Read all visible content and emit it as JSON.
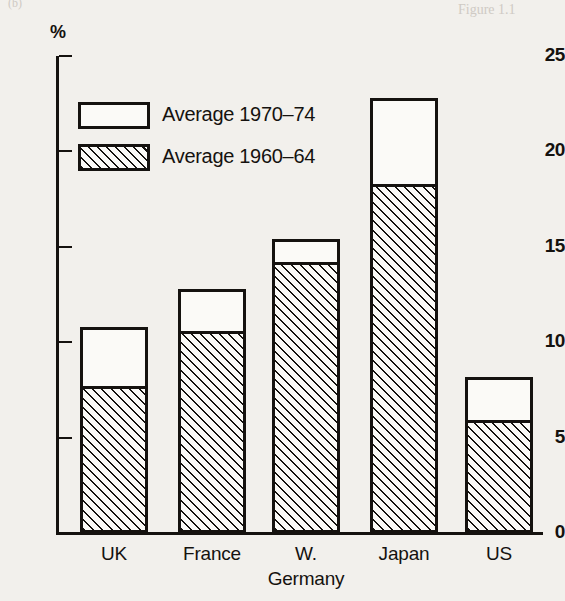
{
  "chart_data": {
    "type": "bar",
    "subtype": "stacked-bar",
    "title": "",
    "subtitle": "",
    "xlabel": "",
    "ylabel": "%",
    "ylim": [
      0,
      25
    ],
    "yticks": [
      0,
      5,
      10,
      15,
      20,
      25
    ],
    "ytick_labels": [
      "0",
      "5",
      "10",
      "15",
      "20",
      "25"
    ],
    "grid": false,
    "legend_position": "upper-left",
    "categories": [
      "UK",
      "France",
      "W.\nGermany",
      "Japan",
      "US"
    ],
    "category_labels": [
      {
        "line1": "UK",
        "line2": ""
      },
      {
        "line1": "France",
        "line2": ""
      },
      {
        "line1": "W.",
        "line2": "Germany"
      },
      {
        "line1": "Japan",
        "line2": ""
      },
      {
        "line1": "US",
        "line2": ""
      }
    ],
    "series": [
      {
        "name": "Average 1960–64",
        "fill": "hatched",
        "values": [
          7.7,
          10.6,
          14.2,
          18.3,
          5.9
        ]
      },
      {
        "name": "Average 1970–74",
        "fill": "white",
        "values": [
          10.8,
          12.8,
          15.4,
          22.8,
          8.2
        ],
        "note": "values are cumulative bar tops; white segment is the increment above the hatched segment"
      }
    ],
    "bar_totals": [
      10.8,
      12.8,
      15.4,
      22.8,
      8.2
    ],
    "colors": {
      "ink": "#15120f",
      "paper": "#f2f0ec",
      "bar_fill": "#fbfaf7"
    }
  },
  "legend": {
    "items": [
      {
        "label": "Average 1970–74",
        "fill": "white"
      },
      {
        "label": "Average 1960–64",
        "fill": "hatched"
      }
    ]
  },
  "axis": {
    "unit": "%"
  },
  "scan_artifacts": {
    "top_left": "(b)",
    "top_right": "Figure 1.1"
  }
}
